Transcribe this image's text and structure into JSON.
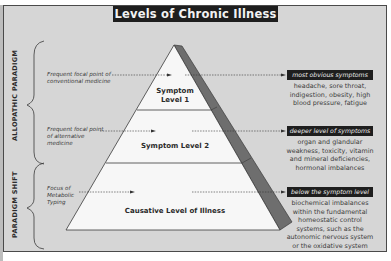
{
  "title": "Levels of Chronic Illness",
  "paradigms": [
    {
      "label": "ALLOPATHIC PARADIGM"
    },
    {
      "label": "PARADIGM SHIFT"
    }
  ],
  "focus_points": [
    {
      "text": "Frequent focal point of conventional medicine"
    },
    {
      "text": "Frequent focal point of alternative medicine"
    },
    {
      "text": "Focus of Metabolic Typing"
    }
  ],
  "levels": [
    {
      "label": "Symptom Level 1",
      "tag": "most obvious symptoms",
      "description": "headache, sore throat, indigestion, obesity, high blood pressure, fatigue"
    },
    {
      "label": "Symptom Level 2",
      "tag": "deeper level of symptoms",
      "description": "organ and glandular weakness, toxicity, vitamin and mineral deficiencies, hormonal imbalances"
    },
    {
      "label": "Causative Level of Illness",
      "tag": "below the symptom level",
      "description": "biochemical imbalances within the fundamental homeostatic control systems, such as the autonomic nervous system or the oxidative system"
    }
  ],
  "colors": {
    "panel": "#d6d6d6",
    "title_bg": "#1e1e1e",
    "pyramid_face": "#f7f7f7",
    "pyramid_side": "#6e6e6e",
    "tag_bg": "#1e1e1e"
  }
}
